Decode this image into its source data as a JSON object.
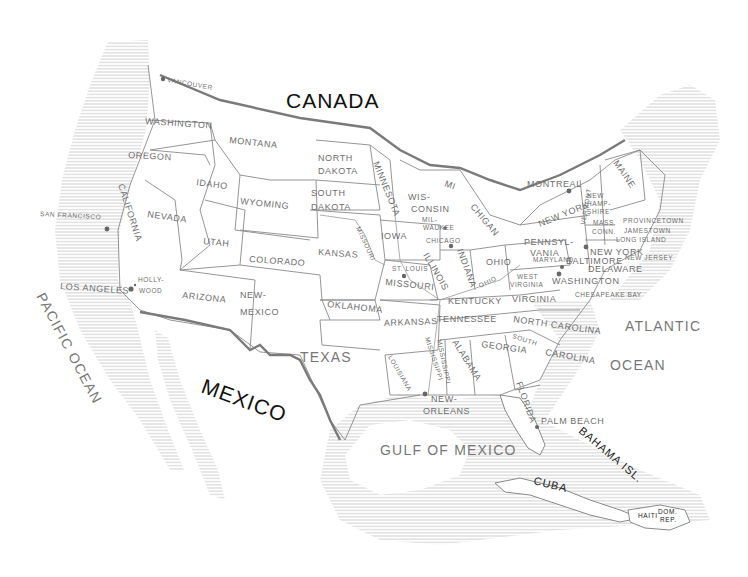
{
  "map": {
    "title": "Hand-drawn map of the United States",
    "countries": [
      "CANADA",
      "MEXICO"
    ],
    "oceans": {
      "pacific": "PACIFIC OCEAN",
      "atlantic_1": "ATLANTIC",
      "atlantic_2": "OCEAN",
      "gulf": "GULF OF MEXICO"
    },
    "islands": {
      "cuba": "CUBA",
      "bahamas": "BAHAMA ISL.",
      "haiti": "HAITI",
      "dom_rep_1": "DOM.",
      "dom_rep_2": "REP."
    },
    "states": {
      "washington": "WASHINGTON",
      "oregon": "OREGON",
      "california": "CALIFORNIA",
      "nevada": "NEVADA",
      "idaho": "IDAHO",
      "montana": "MONTANA",
      "wyoming": "WYOMING",
      "utah": "UTAH",
      "arizona": "ARIZONA",
      "colorado": "COLORADO",
      "new_mexico_1": "NEW-",
      "new_mexico_2": "MEXICO",
      "north_dakota_1": "NORTH",
      "north_dakota_2": "DAKOTA",
      "south_dakota_1": "SOUTH",
      "south_dakota_2": "DAKOTA",
      "kansas": "KANSAS",
      "oklahoma": "OKLAHOMA",
      "texas": "TEXAS",
      "minnesota": "MINNESOTA",
      "iowa": "IOWA",
      "missouri": "MISSOURI",
      "arkansas": "ARKANSAS",
      "louisiana": "LOUISIANA",
      "wisconsin_1": "WIS-",
      "wisconsin_2": "CONSIN",
      "illinois": "ILLINOIS",
      "michigan_1": "MI",
      "michigan_2": "CHIGAN",
      "indiana": "INDIANA",
      "ohio": "OHIO",
      "kentucky": "KENTUCKY",
      "tennessee": "TENNESSEE",
      "mississippi": "MISSISSIPPI",
      "alabama": "ALABAMA",
      "georgia": "GEORGIA",
      "florida": "FLORIDA",
      "south_carolina_1": "SOUTH",
      "south_carolina_2": "CAROLINA",
      "north_carolina": "NORTH CAROLINA",
      "virginia": "VIRGINIA",
      "west_virginia_1": "WEST",
      "west_virginia_2": "VIRGINIA",
      "maryland": "MARYLAND",
      "delaware": "DELAWARE",
      "new_jersey": "NEW JERSEY",
      "pennsylvania_1": "PENNSYL-",
      "pennsylvania_2": "VANIA",
      "new_york": "NEW YORK",
      "vermont": "VERMONT",
      "new_hampshire_1": "NEW",
      "new_hampshire_2": "HAMP-",
      "new_hampshire_3": "SHIRE",
      "massachusetts": "MASS.",
      "connecticut": "CONN.",
      "maine": "MAINE"
    },
    "cities": {
      "vancouver": "VANCOUVER",
      "san_francisco": "SAN FRANCISCO",
      "los_angeles": "LOS ANGELES",
      "hollywood_1": "HOLLY-",
      "hollywood_2": "WOOD",
      "st_louis": "ST. LOUIS",
      "milwaukee_1": "MIL-",
      "milwaukee_2": "WAUKEE",
      "chicago": "CHICAGO",
      "new_orleans_1": "NEW-",
      "new_orleans_2": "ORLEANS",
      "montreal": "MONTREAL",
      "new_york_city": "NEW YORK",
      "baltimore": "BALTIMORE",
      "washington_dc": "WASHINGTON",
      "provincetown": "PROVINCETOWN",
      "jamestown": "JAMESTOWN",
      "long_island": "LONG ISLAND",
      "chesapeake_bay": "CHESAPEAKE BAY",
      "palm_beach": "PALM BEACH"
    },
    "rivers": {
      "missouri_river": "MISSOURI",
      "mississippi_river": "MISSISSIPPI",
      "ohio_river": "OHIO"
    },
    "colors": {
      "ink": "#7a7a7a",
      "dark_ink": "#111111",
      "hatch": "#b5b5b5",
      "paper": "#ffffff"
    }
  }
}
